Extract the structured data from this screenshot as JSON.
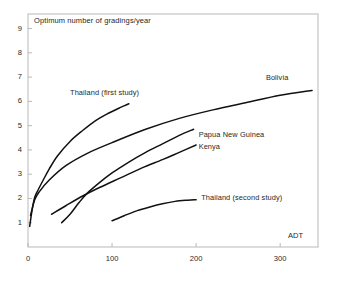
{
  "chart_data": {
    "type": "line",
    "title": "Optimum number of gradings/year",
    "xlabel": "ADT",
    "ylabel": "Optimum number of gradings/year",
    "xlim": [
      0,
      345
    ],
    "ylim": [
      0,
      9.6
    ],
    "xticks": [
      0,
      100,
      200,
      300
    ],
    "xtick_labels": [
      "0",
      "100",
      "200",
      "300"
    ],
    "yticks": [
      1,
      2,
      3,
      4,
      5,
      6,
      7,
      8,
      9
    ],
    "ytick_labels": [
      "1",
      "2",
      "3",
      "4",
      "5",
      "6",
      "7",
      "8",
      "9"
    ],
    "grid": false,
    "legend": "inline-annotations",
    "line_color": "#111111",
    "frame_color": "#b9b9b9",
    "background": "#ffffff",
    "series": [
      {
        "name": "Thailand (first study)",
        "label": "Thailand (first study)",
        "label_x": 50,
        "label_y": 6.35,
        "points": [
          [
            2,
            0.85
          ],
          [
            5,
            1.55
          ],
          [
            8,
            2.05
          ],
          [
            12,
            2.35
          ],
          [
            18,
            2.75
          ],
          [
            25,
            3.2
          ],
          [
            35,
            3.75
          ],
          [
            50,
            4.35
          ],
          [
            65,
            4.8
          ],
          [
            80,
            5.2
          ],
          [
            95,
            5.5
          ],
          [
            110,
            5.75
          ],
          [
            120,
            5.9
          ]
        ]
      },
      {
        "name": "Bolivia",
        "label": "Bolivia",
        "label_x": 283,
        "label_y": 6.95,
        "points": [
          [
            3,
            1.3
          ],
          [
            8,
            1.95
          ],
          [
            14,
            2.3
          ],
          [
            25,
            2.75
          ],
          [
            45,
            3.35
          ],
          [
            70,
            3.85
          ],
          [
            100,
            4.3
          ],
          [
            140,
            4.85
          ],
          [
            180,
            5.3
          ],
          [
            220,
            5.65
          ],
          [
            260,
            5.95
          ],
          [
            300,
            6.25
          ],
          [
            338,
            6.45
          ]
        ]
      },
      {
        "name": "Papua New Guinea",
        "label": "Papua New Guinea",
        "label_x": 203,
        "label_y": 4.62,
        "points": [
          [
            40,
            1.0
          ],
          [
            50,
            1.35
          ],
          [
            60,
            1.8
          ],
          [
            70,
            2.2
          ],
          [
            85,
            2.65
          ],
          [
            100,
            3.05
          ],
          [
            120,
            3.5
          ],
          [
            140,
            3.9
          ],
          [
            160,
            4.25
          ],
          [
            180,
            4.6
          ],
          [
            197,
            4.85
          ]
        ]
      },
      {
        "name": "Kenya",
        "label": "Kenya",
        "label_x": 203,
        "label_y": 4.1,
        "points": [
          [
            28,
            1.35
          ],
          [
            45,
            1.7
          ],
          [
            65,
            2.1
          ],
          [
            85,
            2.45
          ],
          [
            110,
            2.85
          ],
          [
            135,
            3.25
          ],
          [
            160,
            3.6
          ],
          [
            180,
            3.9
          ],
          [
            200,
            4.2
          ]
        ]
      },
      {
        "name": "Thailand (second study)",
        "label": "Thailand (second study)",
        "label_x": 206,
        "label_y": 2.0,
        "points": [
          [
            100,
            1.08
          ],
          [
            115,
            1.3
          ],
          [
            130,
            1.5
          ],
          [
            145,
            1.65
          ],
          [
            160,
            1.78
          ],
          [
            175,
            1.88
          ],
          [
            190,
            1.93
          ],
          [
            200,
            1.95
          ]
        ]
      }
    ]
  }
}
